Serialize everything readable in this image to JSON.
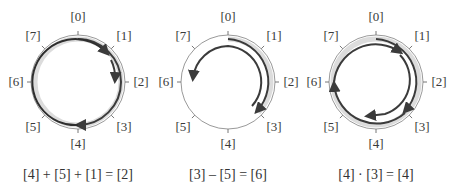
{
  "diagram": {
    "positions": [
      "[0]",
      "[1]",
      "[2]",
      "[3]",
      "[4]",
      "[5]",
      "[6]",
      "[7]"
    ],
    "colors": {
      "ring": "#9a9a9a",
      "band": "#d9d9d9",
      "arrow": "#3b3b3b",
      "text": "#333333"
    },
    "panels": [
      {
        "id": "addition",
        "equation": "[4] + [5] + [1] = [2]"
      },
      {
        "id": "subtraction",
        "equation": "[3] – [5] = [6]"
      },
      {
        "id": "multiplication",
        "equation": "[4] · [3] = [4]"
      }
    ]
  }
}
